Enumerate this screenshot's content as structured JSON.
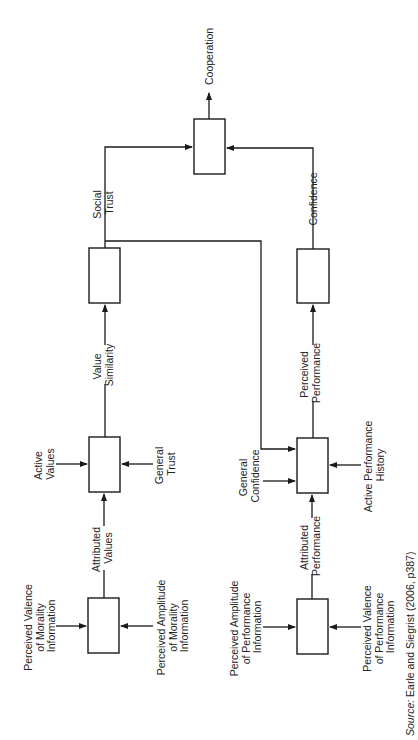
{
  "diagram": {
    "orientation": "rotated 90 degrees counter-clockwise",
    "nodes": {
      "cooperation": {
        "label": "Cooperation"
      },
      "social_trust": {
        "label_line1": "Social",
        "label_line2": "Trust"
      },
      "confidence": {
        "label": "Confidence"
      },
      "value_similarity": {
        "label_line1": "Value",
        "label_line2": "Similarity"
      },
      "perceived_performance": {
        "label_line1": "Perceived",
        "label_line2": "Performance"
      },
      "active_values": {
        "label_line1": "Active",
        "label_line2": "Values"
      },
      "general_trust": {
        "label_line1": "General",
        "label_line2": "Trust"
      },
      "attributed_values": {
        "label_line1": "Attributed",
        "label_line2": "Values"
      },
      "general_confidence": {
        "label_line1": "General",
        "label_line2": "Confidence"
      },
      "active_performance_history": {
        "label_line1": "Active Performance",
        "label_line2": "History"
      },
      "attributed_performance": {
        "label_line1": "Attributed",
        "label_line2": "Performance"
      },
      "valence_morality": {
        "label_line1": "Perceived Valence",
        "label_line2": "of Morality",
        "label_line3": "Information"
      },
      "amplitude_morality": {
        "label_line1": "Perceived Amplitude",
        "label_line2": "of Morality",
        "label_line3": "Information"
      },
      "amplitude_performance": {
        "label_line1": "Perceived Amplitude",
        "label_line2": "of Performance",
        "label_line3": "Information"
      },
      "valence_performance": {
        "label_line1": "Perceived Valence",
        "label_line2": "of Performance",
        "label_line3": "Information"
      }
    },
    "edges": [
      {
        "from": "valence_morality",
        "to": "attributed_values"
      },
      {
        "from": "amplitude_morality",
        "to": "attributed_values"
      },
      {
        "from": "attributed_values",
        "to": "value_similarity"
      },
      {
        "from": "active_values",
        "to": "value_similarity"
      },
      {
        "from": "general_trust",
        "to": "value_similarity"
      },
      {
        "from": "value_similarity",
        "to": "social_trust"
      },
      {
        "from": "social_trust",
        "to": "cooperation"
      },
      {
        "from": "social_trust",
        "to": "perceived_performance"
      },
      {
        "from": "amplitude_performance",
        "to": "attributed_performance"
      },
      {
        "from": "valence_performance",
        "to": "attributed_performance"
      },
      {
        "from": "attributed_performance",
        "to": "perceived_performance"
      },
      {
        "from": "general_confidence",
        "to": "perceived_performance"
      },
      {
        "from": "active_performance_history",
        "to": "perceived_performance"
      },
      {
        "from": "perceived_performance",
        "to": "confidence"
      },
      {
        "from": "confidence",
        "to": "cooperation"
      }
    ]
  },
  "source": {
    "prefix": "Source:",
    "text": " Earle and Siegrist (2006, p387)"
  },
  "colors": {
    "line": "#1a1a1a",
    "text": "#222222",
    "background": "#ffffff"
  }
}
